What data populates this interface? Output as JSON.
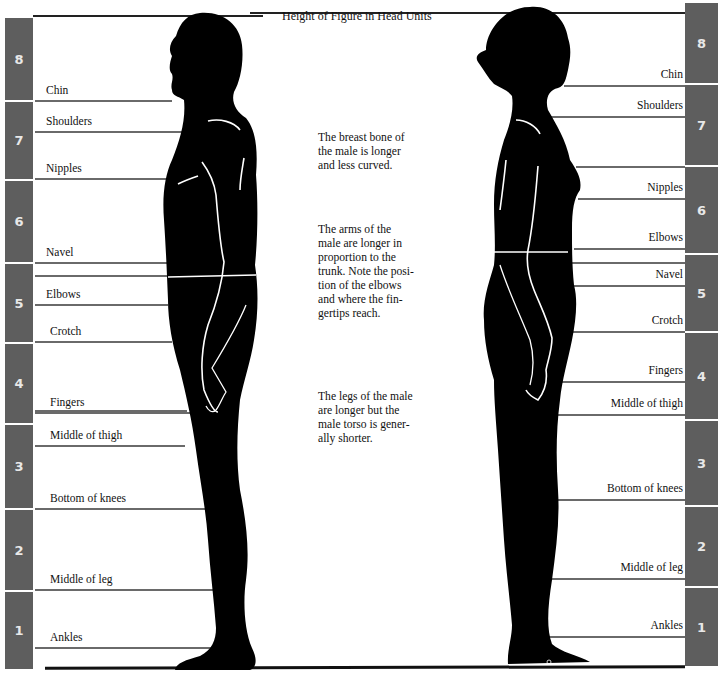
{
  "title": "Height of Figure in Head Units",
  "head_units_left": [
    {
      "n": "8",
      "top": 18,
      "h": 82
    },
    {
      "n": "7",
      "top": 102,
      "h": 77
    },
    {
      "n": "6",
      "top": 181,
      "h": 81
    },
    {
      "n": "5",
      "top": 264,
      "h": 78
    },
    {
      "n": "4",
      "top": 344,
      "h": 79
    },
    {
      "n": "3",
      "top": 425,
      "h": 83
    },
    {
      "n": "2",
      "top": 510,
      "h": 80
    },
    {
      "n": "1",
      "top": 592,
      "h": 77
    }
  ],
  "head_units_right": [
    {
      "n": "8",
      "top": 3,
      "h": 80
    },
    {
      "n": "7",
      "top": 85,
      "h": 80
    },
    {
      "n": "6",
      "top": 167,
      "h": 86
    },
    {
      "n": "5",
      "top": 255,
      "h": 76
    },
    {
      "n": "4",
      "top": 333,
      "h": 86
    },
    {
      "n": "3",
      "top": 421,
      "h": 84
    },
    {
      "n": "2",
      "top": 507,
      "h": 79
    },
    {
      "n": "1",
      "top": 588,
      "h": 78
    }
  ],
  "male_labels": [
    {
      "text": "Chin",
      "y": 84
    },
    {
      "text": "Shoulders",
      "y": 115
    },
    {
      "text": "Nipples",
      "y": 162
    },
    {
      "text": "Navel",
      "y": 246
    },
    {
      "text": "Elbows",
      "y": 288
    },
    {
      "text": "Crotch",
      "y": 325
    },
    {
      "text": "Fingers",
      "y": 396
    },
    {
      "text": "Middle of thigh",
      "y": 429
    },
    {
      "text": "Bottom of knees",
      "y": 492
    },
    {
      "text": "Middle of leg",
      "y": 573
    },
    {
      "text": "Ankles",
      "y": 631
    }
  ],
  "female_labels": [
    {
      "text": "Chin",
      "y": 68
    },
    {
      "text": "Shoulders",
      "y": 99
    },
    {
      "text": "Nipples",
      "y": 181
    },
    {
      "text": "Elbows",
      "y": 231
    },
    {
      "text": "Navel",
      "y": 268
    },
    {
      "text": "Crotch",
      "y": 314
    },
    {
      "text": "Fingers",
      "y": 364
    },
    {
      "text": "Middle of thigh",
      "y": 397
    },
    {
      "text": "Bottom of knees",
      "y": 482
    },
    {
      "text": "Middle of leg",
      "y": 561
    },
    {
      "text": "Ankles",
      "y": 619
    }
  ],
  "notes": [
    {
      "lines": [
        "The breast bone of",
        "the male is longer",
        "and less curved."
      ],
      "top": 131
    },
    {
      "lines": [
        "The arms of the",
        "male are longer in",
        "proportion to the",
        "trunk. Note the posi-",
        "tion of the elbows",
        "and where the fin-",
        "gertips reach."
      ],
      "top": 223
    },
    {
      "lines": [
        "The legs of the male",
        "are longer but the",
        "male torso is gener-",
        "ally shorter."
      ],
      "top": 390
    }
  ],
  "colors": {
    "unit_bar": "#5e5e5e",
    "guide_line": "#6a6a6a",
    "silhouette": "#000000"
  }
}
